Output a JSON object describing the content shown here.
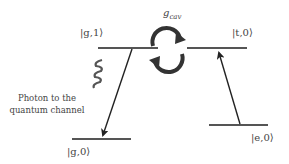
{
  "levels": {
    "g1": {
      "label": "|g,1⟩"
    },
    "t0": {
      "label": "|t,0⟩"
    },
    "g0": {
      "label": "|g,0⟩"
    },
    "e0": {
      "label": "|e,0⟩"
    }
  },
  "coupling": {
    "label": "g",
    "subscript": "cav"
  },
  "photon_caption": {
    "line1": "Photon to the",
    "line2": "quantum channel"
  },
  "colors": {
    "line": "#555555",
    "arrow": "#222222",
    "coupling_arrow": "#333333"
  }
}
